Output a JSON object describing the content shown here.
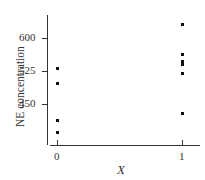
{
  "chart_data": {
    "type": "scatter",
    "title": "",
    "xlabel": "X",
    "ylabel": "NE concentration",
    "x_ticks": [
      "0",
      "1"
    ],
    "y_ticks": [
      "450",
      "525",
      "600"
    ],
    "ylim": [
      355,
      650
    ],
    "grid": false,
    "legend": null,
    "series": [
      {
        "name": "NE concentration",
        "points": [
          {
            "x": 0,
            "y": 532
          },
          {
            "x": 0,
            "y": 498
          },
          {
            "x": 0,
            "y": 414
          },
          {
            "x": 0,
            "y": 386
          },
          {
            "x": 1,
            "y": 632
          },
          {
            "x": 1,
            "y": 564
          },
          {
            "x": 1,
            "y": 548
          },
          {
            "x": 1,
            "y": 541
          },
          {
            "x": 1,
            "y": 520
          },
          {
            "x": 1,
            "y": 430
          }
        ]
      }
    ]
  }
}
